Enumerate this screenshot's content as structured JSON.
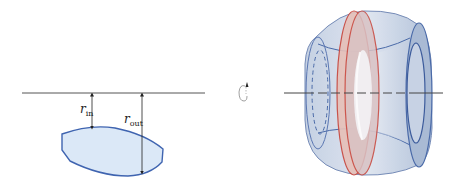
{
  "diagram": {
    "left_panel": {
      "labels": {
        "r_in": {
          "main": "r",
          "sub": "in"
        },
        "r_out": {
          "main": "r",
          "sub": "out"
        }
      },
      "region_fill": "#dbe8f7",
      "region_stroke": "#3f64b0",
      "axis_color": "#555555"
    },
    "rotation_icon": "rotate-around-axis-icon",
    "right_panel": {
      "solid_fill": "#b9c8de",
      "solid_stroke": "#4a6aa8",
      "washer_fill": "#e9c3bb",
      "washer_stroke": "#c8443a",
      "axis_color": "#444444"
    }
  }
}
